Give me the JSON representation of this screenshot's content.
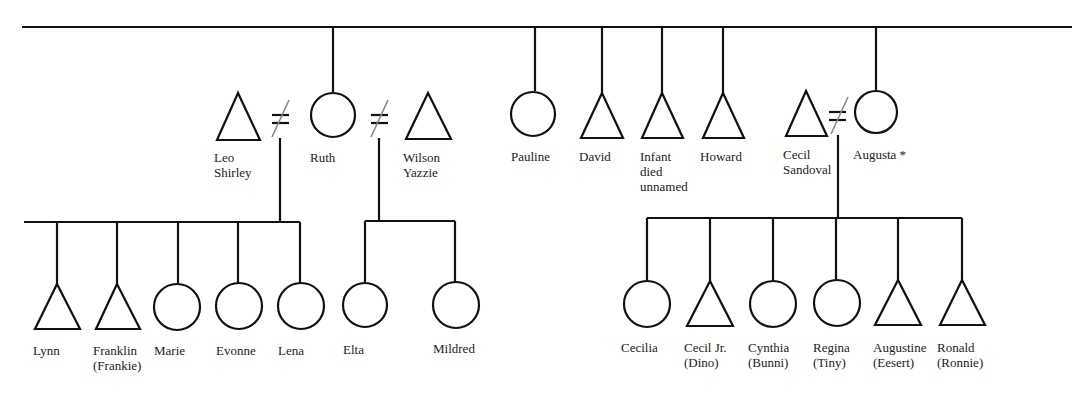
{
  "diagram": {
    "type": "kinship-chart",
    "legend_symbols": {
      "male": "triangle",
      "female": "circle",
      "divorced": "slashed-equals"
    },
    "parents_generation": [
      {
        "name": "Ruth",
        "sex": "female",
        "x": 333
      },
      {
        "name": "Pauline",
        "sex": "female",
        "x": 535
      },
      {
        "name": "David",
        "sex": "male",
        "x": 602
      },
      {
        "name": "Infant died unnamed",
        "sex": "male",
        "x": 662
      },
      {
        "name": "Howard",
        "sex": "male",
        "x": 723
      },
      {
        "name": "Augusta *",
        "sex": "female",
        "x": 876
      }
    ],
    "spouses": [
      {
        "name": "Leo Shirley",
        "sex": "male",
        "line1": "Leo",
        "line2": "Shirley"
      },
      {
        "name": "Wilson Yazzie",
        "sex": "male",
        "line1": "Wilson",
        "line2": "Yazzie"
      },
      {
        "name": "Cecil Sandoval",
        "sex": "male",
        "line1": "Cecil",
        "line2": "Sandoval"
      }
    ],
    "labels": {
      "leo": [
        "Leo",
        "Shirley"
      ],
      "ruth": "Ruth",
      "wilson": [
        "Wilson",
        "Yazzie"
      ],
      "pauline": "Pauline",
      "david": "David",
      "infant": [
        "Infant",
        "died",
        "unnamed"
      ],
      "howard": "Howard",
      "cecil": [
        "Cecil",
        "Sandoval"
      ],
      "augusta": "Augusta *"
    },
    "children_leo_ruth": [
      {
        "name": "Lynn",
        "sex": "male",
        "line1": "Lynn",
        "line2": ""
      },
      {
        "name": "Franklin (Frankie)",
        "sex": "male",
        "line1": "Franklin",
        "line2": "(Frankie)"
      },
      {
        "name": "Marie",
        "sex": "female",
        "line1": "Marie",
        "line2": ""
      },
      {
        "name": "Evonne",
        "sex": "female",
        "line1": "Evonne",
        "line2": ""
      },
      {
        "name": "Lena",
        "sex": "female",
        "line1": "Lena",
        "line2": ""
      }
    ],
    "children_wilson_ruth": [
      {
        "name": "Elta",
        "sex": "female",
        "line1": "Elta",
        "line2": ""
      },
      {
        "name": "Mildred",
        "sex": "female",
        "line1": "Mildred",
        "line2": ""
      }
    ],
    "children_cecil_augusta": [
      {
        "name": "Cecilia",
        "sex": "female",
        "line1": "Cecilia",
        "line2": ""
      },
      {
        "name": "Cecil Jr. (Dino)",
        "sex": "male",
        "line1": "Cecil Jr.",
        "line2": "(Dino)"
      },
      {
        "name": "Cynthia (Bunni)",
        "sex": "female",
        "line1": "Cynthia",
        "line2": "(Bunni)"
      },
      {
        "name": "Regina (Tiny)",
        "sex": "female",
        "line1": "Regina",
        "line2": "(Tiny)"
      },
      {
        "name": "Augustine (Eesert)",
        "sex": "male",
        "line1": "Augustine",
        "line2": "(Eesert)"
      },
      {
        "name": "Ronald (Ronnie)",
        "sex": "male",
        "line1": "Ronald",
        "line2": "(Ronnie)"
      }
    ],
    "colors": {
      "line": "#111111",
      "divorce_slash": "#888888",
      "text": "#222222",
      "background": "#ffffff"
    }
  }
}
